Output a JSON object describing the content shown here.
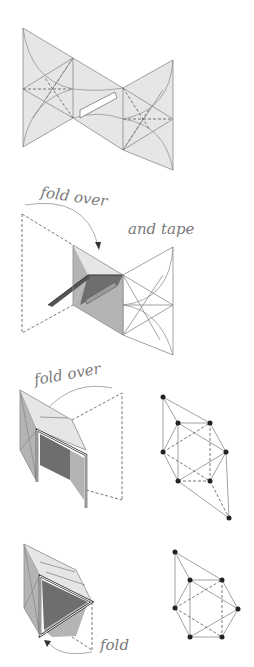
{
  "figure": {
    "type": "origami-folding-instructions",
    "steps": [
      {
        "id": "step-1",
        "label": "",
        "description": "Flat crease pattern of three connected panels with a tab"
      },
      {
        "id": "step-2",
        "label": "fold over",
        "label2": "and tape",
        "description": "Left panel folded over and taped"
      },
      {
        "id": "step-3",
        "label": "fold over",
        "description": "Partially folded box shape with dashed outline"
      },
      {
        "id": "step-4",
        "label": "fold",
        "description": "Final folded polyhedron"
      }
    ],
    "graphs": [
      {
        "id": "graph-1",
        "description": "Vertex-edge graph for step 3",
        "vertex_count": 9
      },
      {
        "id": "graph-2",
        "description": "Vertex-edge graph for step 4",
        "vertex_count": 8
      }
    ]
  },
  "colors": {
    "panel_fill": "#e6e6e6",
    "shade_mid": "#b4b4b4",
    "shade_dark": "#6e6e6e",
    "line": "#8a8a8a",
    "vertex": "#222222"
  }
}
